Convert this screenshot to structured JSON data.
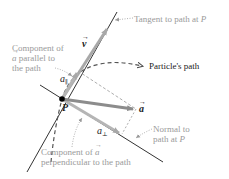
{
  "diagram": {
    "point_label": "P",
    "labels": {
      "tangent": "Tangent to path at P",
      "tangent_prefix": "Tangent to path at ",
      "tangent_point": "P",
      "path": "Particle's path",
      "parallel_line1": "Component of",
      "parallel_line2_sym": "a",
      "parallel_line2_text": " parallel to",
      "parallel_line3": "the path",
      "normal_line1": "Normal to",
      "normal_line2_prefix": "path at ",
      "normal_line2_point": "P",
      "perp_line1_text": "Component of ",
      "perp_line1_sym": "a",
      "perp_line2": "perpendicular to the path"
    },
    "symbols": {
      "velocity": "v",
      "acceleration": "a",
      "a_parallel_base": "a",
      "a_parallel_sub": "∥",
      "a_perp_base": "a",
      "a_perp_sub": "⊥"
    },
    "colors": {
      "line": "#333333",
      "arrow": "#a8a8a8",
      "accel_arrow": "#8c8c8c",
      "dashed": "#555555",
      "label_gray": "#9a9a9a",
      "text_dark": "#1a1a1a"
    }
  }
}
